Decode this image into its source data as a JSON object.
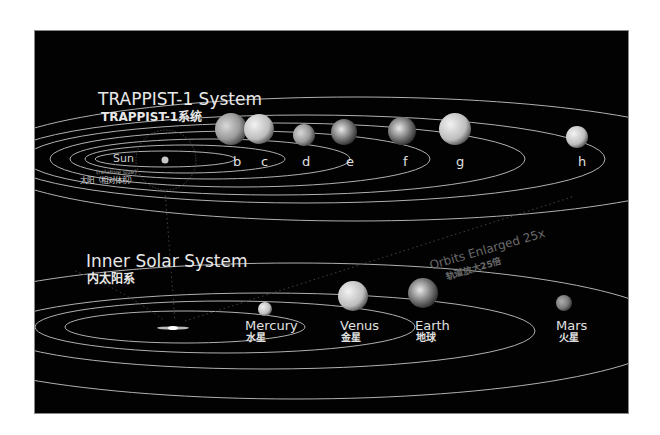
{
  "trappist": {
    "title_en": "TRAPPIST-1 System",
    "title_zh": "TRAPPIST-1系统",
    "sun_label": "Sun",
    "sun_note": "(relative size)",
    "sun_label_zh": "太阳（相对体积）",
    "planets": [
      {
        "id": "b",
        "label": "b"
      },
      {
        "id": "c",
        "label": "c"
      },
      {
        "id": "d",
        "label": "d"
      },
      {
        "id": "e",
        "label": "e"
      },
      {
        "id": "f",
        "label": "f"
      },
      {
        "id": "g",
        "label": "g"
      },
      {
        "id": "h",
        "label": "h"
      }
    ]
  },
  "scale_note": {
    "en": "Orbits Enlarged 25x",
    "zh": "轨道放大25倍"
  },
  "inner": {
    "title_en": "Inner Solar System",
    "title_zh": "内太阳系",
    "planets": [
      {
        "id": "mercury",
        "label": "Mercury",
        "label_zh": "水星"
      },
      {
        "id": "venus",
        "label": "Venus",
        "label_zh": "金星"
      },
      {
        "id": "earth",
        "label": "Earth",
        "label_zh": "地球"
      },
      {
        "id": "mars",
        "label": "Mars",
        "label_zh": "火星"
      }
    ]
  },
  "colors": {
    "background": "#020202",
    "orbit": "#cfcfcf",
    "text": "#e6e6e6",
    "page": "#ffffff"
  }
}
